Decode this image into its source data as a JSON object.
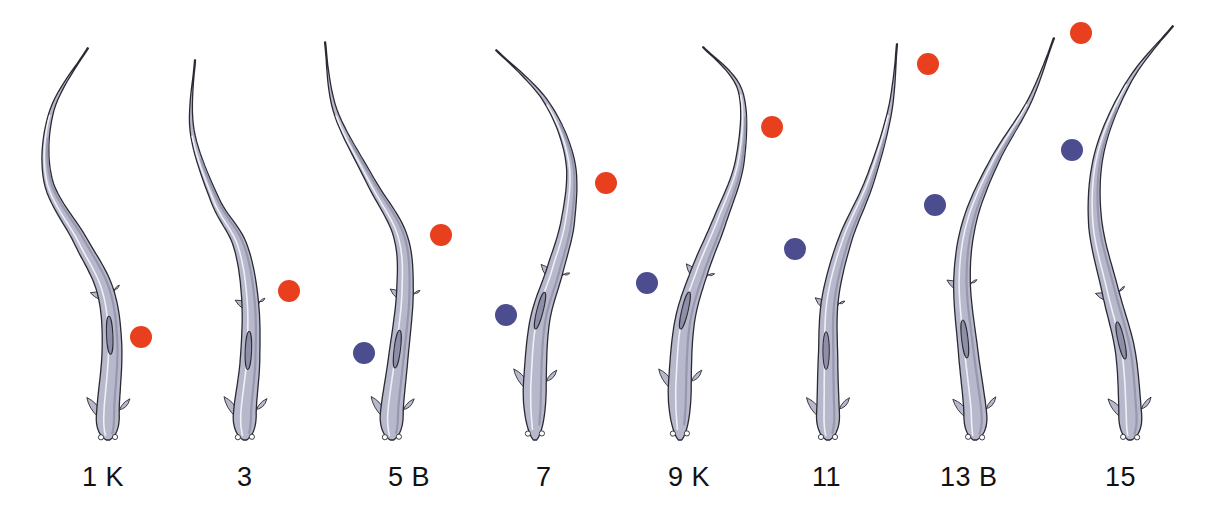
{
  "figure": {
    "colors": {
      "body_fill": "#b8b8cc",
      "body_shade": "#8e8ea6",
      "body_outline": "#2a2a33",
      "highlight": "#eef0f6",
      "red_dot": "#e8401e",
      "blue_dot": "#4b4d8f"
    },
    "frames": [
      {
        "label": "1 K",
        "label_x": 82,
        "spine": [
          [
            88,
            48
          ],
          [
            52,
            110
          ],
          [
            48,
            180
          ],
          [
            80,
            240
          ],
          [
            105,
            290
          ],
          [
            112,
            345
          ],
          [
            108,
            410
          ],
          [
            108,
            440
          ]
        ],
        "dots": [
          {
            "color": "red",
            "x": 141,
            "y": 337
          }
        ]
      },
      {
        "label": "3",
        "label_x": 237,
        "spine": [
          [
            195,
            60
          ],
          [
            192,
            130
          ],
          [
            215,
            200
          ],
          [
            240,
            245
          ],
          [
            250,
            300
          ],
          [
            250,
            360
          ],
          [
            245,
            410
          ],
          [
            245,
            440
          ]
        ],
        "dots": [
          {
            "color": "red",
            "x": 289,
            "y": 291
          }
        ]
      },
      {
        "label": "5 B",
        "label_x": 388,
        "spine": [
          [
            325,
            42
          ],
          [
            335,
            110
          ],
          [
            370,
            180
          ],
          [
            400,
            235
          ],
          [
            405,
            290
          ],
          [
            398,
            360
          ],
          [
            392,
            410
          ],
          [
            392,
            440
          ]
        ],
        "dots": [
          {
            "color": "red",
            "x": 441,
            "y": 235
          },
          {
            "color": "blue",
            "x": 364,
            "y": 353
          }
        ]
      },
      {
        "label": "7",
        "label_x": 536,
        "spine": [
          [
            496,
            50
          ],
          [
            545,
            100
          ],
          [
            570,
            160
          ],
          [
            568,
            220
          ],
          [
            555,
            270
          ],
          [
            540,
            320
          ],
          [
            535,
            380
          ],
          [
            535,
            440
          ]
        ],
        "dots": [
          {
            "color": "red",
            "x": 606,
            "y": 183
          },
          {
            "color": "blue",
            "x": 506,
            "y": 315
          }
        ]
      },
      {
        "label": "9 K",
        "label_x": 668,
        "spine": [
          [
            703,
            47
          ],
          [
            740,
            90
          ],
          [
            740,
            160
          ],
          [
            720,
            220
          ],
          [
            700,
            270
          ],
          [
            685,
            320
          ],
          [
            680,
            380
          ],
          [
            680,
            440
          ]
        ],
        "dots": [
          {
            "color": "red",
            "x": 772,
            "y": 127
          },
          {
            "color": "blue",
            "x": 647,
            "y": 283
          }
        ]
      },
      {
        "label": "11",
        "label_x": 812,
        "spine": [
          [
            897,
            44
          ],
          [
            890,
            110
          ],
          [
            870,
            180
          ],
          [
            845,
            240
          ],
          [
            830,
            300
          ],
          [
            828,
            360
          ],
          [
            828,
            410
          ],
          [
            828,
            440
          ]
        ],
        "dots": [
          {
            "color": "red",
            "x": 928,
            "y": 64
          },
          {
            "color": "blue",
            "x": 795,
            "y": 249
          }
        ]
      },
      {
        "label": "13 B",
        "label_x": 940,
        "spine": [
          [
            1054,
            38
          ],
          [
            1030,
            100
          ],
          [
            995,
            160
          ],
          [
            970,
            220
          ],
          [
            962,
            280
          ],
          [
            968,
            350
          ],
          [
            975,
            410
          ],
          [
            975,
            440
          ]
        ],
        "dots": [
          {
            "color": "red",
            "x": 1081,
            "y": 33
          },
          {
            "color": "blue",
            "x": 935,
            "y": 205
          },
          {
            "color": "blue",
            "x": 1072,
            "y": 150
          }
        ]
      },
      {
        "label": "15",
        "label_x": 1105,
        "spine": [
          [
            1173,
            26
          ],
          [
            1130,
            80
          ],
          [
            1100,
            150
          ],
          [
            1095,
            220
          ],
          [
            1110,
            290
          ],
          [
            1125,
            350
          ],
          [
            1130,
            410
          ],
          [
            1130,
            440
          ]
        ],
        "dots": []
      }
    ]
  }
}
